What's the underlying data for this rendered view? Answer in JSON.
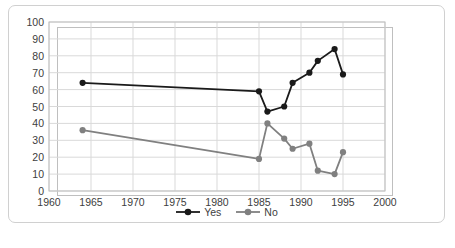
{
  "chart_data": {
    "type": "line",
    "title": "",
    "xlabel": "",
    "ylabel": "",
    "xlim": [
      1960,
      2000
    ],
    "ylim": [
      0,
      100
    ],
    "xticks": [
      1960,
      1965,
      1970,
      1975,
      1980,
      1985,
      1990,
      1995,
      2000
    ],
    "yticks": [
      0,
      10,
      20,
      30,
      40,
      50,
      60,
      70,
      80,
      90,
      100
    ],
    "grid": "horizontal-and-vertical",
    "legend_position": "bottom-center",
    "markers": "filled-circle",
    "series": [
      {
        "name": "Yes",
        "color": "#1a1a1a",
        "x": [
          1964,
          1985,
          1986,
          1988,
          1989,
          1991,
          1992,
          1994,
          1995
        ],
        "values": [
          64,
          59,
          47,
          50,
          64,
          70,
          77,
          84,
          69
        ]
      },
      {
        "name": "No",
        "color": "#808080",
        "x": [
          1964,
          1985,
          1986,
          1988,
          1989,
          1991,
          1992,
          1994,
          1995
        ],
        "values": [
          36,
          19,
          40,
          31,
          25,
          28,
          12,
          10,
          23
        ]
      }
    ]
  },
  "axes": {
    "y_tick_labels": [
      "100",
      "90",
      "80",
      "70",
      "60",
      "50",
      "40",
      "30",
      "20",
      "10",
      "0"
    ],
    "x_tick_labels": [
      "1960",
      "1965",
      "1970",
      "1975",
      "1980",
      "1985",
      "1990",
      "1995",
      "2000"
    ]
  },
  "legend": {
    "items": [
      {
        "label": "Yes",
        "color": "#1a1a1a"
      },
      {
        "label": "No",
        "color": "#808080"
      }
    ]
  }
}
